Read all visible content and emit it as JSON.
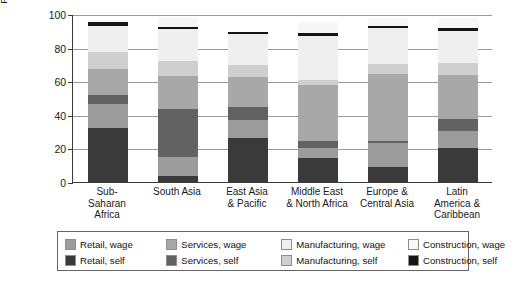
{
  "chart_data": {
    "type": "bar",
    "subtype": "stacked-bar",
    "title": "",
    "xlabel": "",
    "ylabel": "Percentage of total non-farm employment",
    "ylabel_lines": [
      "Percentage of total non-farm",
      "employment"
    ],
    "ylim": [
      0,
      100
    ],
    "yticks": [
      0,
      20,
      40,
      60,
      80,
      100
    ],
    "ytick_labels": [
      "0",
      "20",
      "40",
      "60",
      "80",
      "100"
    ],
    "grid": true,
    "grid_axis": "y",
    "legend_position": "bottom",
    "categories": [
      "Sub-Saharan Africa",
      "South Asia",
      "East Asia & Pacific",
      "Middle East & North Africa",
      "Europe & Central Asia",
      "Latin America & Caribbean"
    ],
    "category_label_lines": [
      [
        "Sub-",
        "Saharan",
        "Africa"
      ],
      [
        "South Asia"
      ],
      [
        "East Asia",
        "& Pacific"
      ],
      [
        "Middle East",
        "& North Africa"
      ],
      [
        "Europe &",
        "Central Asia"
      ],
      [
        "Latin",
        "America &",
        "Caribbean"
      ]
    ],
    "stack_order_bottom_to_top": [
      "Retail, self",
      "Retail, wage",
      "Services, self",
      "Services, wage",
      "Manufacturing, self",
      "Manufacturing, wage",
      "Construction, self",
      "Construction, wage"
    ],
    "series": [
      {
        "name": "Retail, self",
        "color": "#3a3a3a",
        "values": [
          32.0,
          3.5,
          26.0,
          14.5,
          9.0,
          20.0
        ]
      },
      {
        "name": "Retail, wage",
        "color": "#9c9c9c",
        "values": [
          14.5,
          11.5,
          11.0,
          5.5,
          14.0,
          10.5
        ]
      },
      {
        "name": "Services, self",
        "color": "#626262",
        "values": [
          5.5,
          28.5,
          7.5,
          4.5,
          1.5,
          7.0
        ]
      },
      {
        "name": "Services, wage",
        "color": "#a8a8a8",
        "values": [
          15.0,
          19.5,
          18.0,
          33.5,
          40.0,
          26.0
        ]
      },
      {
        "name": "Manufacturing, self",
        "color": "#cfcfcf",
        "values": [
          10.5,
          9.0,
          7.0,
          3.0,
          6.0,
          7.5
        ]
      },
      {
        "name": "Manufacturing, wage",
        "color": "#efefef",
        "values": [
          15.5,
          19.0,
          18.5,
          26.0,
          21.0,
          19.0
        ]
      },
      {
        "name": "Construction, self",
        "color": "#151515",
        "values": [
          2.0,
          1.5,
          1.5,
          1.5,
          1.5,
          1.5
        ]
      },
      {
        "name": "Construction, wage",
        "color": "#f7f7f7",
        "values": [
          1.5,
          6.0,
          0.0,
          6.5,
          4.5,
          6.0
        ]
      }
    ],
    "bar_totals": [
      96.5,
      98.5,
      89.5,
      95.0,
      97.5,
      97.5
    ]
  },
  "legend": {
    "rows": [
      [
        {
          "label": "Retail, wage",
          "color": "#9c9c9c"
        },
        {
          "label": "Services, wage",
          "color": "#a8a8a8"
        },
        {
          "label": "Manufacturing, wage",
          "color": "#efefef"
        },
        {
          "label": "Construction, wage",
          "color": "#f7f7f7"
        }
      ],
      [
        {
          "label": "Retail, self",
          "color": "#3a3a3a"
        },
        {
          "label": "Services, self",
          "color": "#626262"
        },
        {
          "label": "Manufacturing, self",
          "color": "#cfcfcf"
        },
        {
          "label": "Construction, self",
          "color": "#151515"
        }
      ]
    ]
  }
}
